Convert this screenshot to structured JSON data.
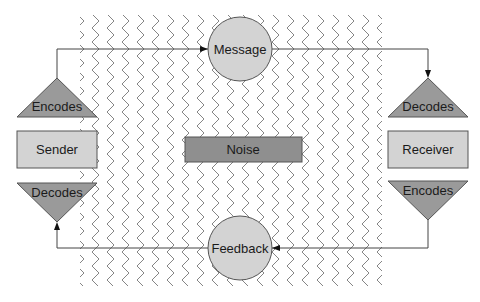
{
  "diagram": {
    "type": "communication-model",
    "nodes": {
      "message": {
        "label": "Message",
        "shape": "circle",
        "fill": "#d3d3d3"
      },
      "feedback": {
        "label": "Feedback",
        "shape": "circle",
        "fill": "#d3d3d3"
      },
      "sender": {
        "label": "Sender",
        "shape": "rectangle",
        "fill": "#d3d3d3"
      },
      "receiver": {
        "label": "Receiver",
        "shape": "rectangle",
        "fill": "#d3d3d3"
      },
      "noise": {
        "label": "Noise",
        "shape": "rectangle",
        "fill": "#8f8f8f"
      },
      "sender_encodes": {
        "label": "Encodes",
        "shape": "triangle-up",
        "fill": "#9a9a9a"
      },
      "sender_decodes": {
        "label": "Decodes",
        "shape": "triangle-down",
        "fill": "#9a9a9a"
      },
      "receiver_decodes": {
        "label": "Decodes",
        "shape": "triangle-up",
        "fill": "#9a9a9a"
      },
      "receiver_encodes": {
        "label": "Encodes",
        "shape": "triangle-down",
        "fill": "#9a9a9a"
      }
    },
    "edges": [
      {
        "from": "sender_encodes",
        "to": "message"
      },
      {
        "from": "message",
        "to": "receiver_decodes"
      },
      {
        "from": "receiver_encodes",
        "to": "feedback"
      },
      {
        "from": "feedback",
        "to": "sender_decodes"
      }
    ],
    "background_pattern": "zigzag-noise"
  }
}
